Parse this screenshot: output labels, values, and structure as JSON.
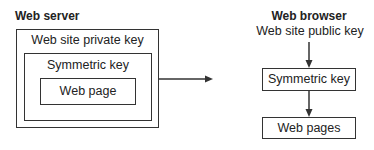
{
  "server": {
    "title": "Web server",
    "outer_label": "Web site private key",
    "middle_label": "Symmetric key",
    "inner_label": "Web page"
  },
  "browser": {
    "title": "Web browser",
    "key_label": "Web site public key",
    "box1_label": "Symmetric key",
    "box2_label": "Web pages"
  }
}
